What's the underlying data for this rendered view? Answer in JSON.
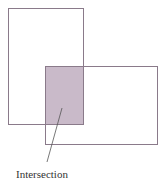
{
  "diagram": {
    "title": "",
    "rect_a": {
      "x": 8,
      "y": 8,
      "w": 75,
      "h": 116
    },
    "rect_b": {
      "x": 45,
      "y": 66,
      "w": 112,
      "h": 78
    },
    "intersection": {
      "x": 45,
      "y": 66,
      "w": 38,
      "h": 58,
      "fill": "#b8a4b8"
    },
    "stroke_color": "#8a7a8a",
    "callout_label": "Intersection",
    "callout_line": {
      "x1": 62,
      "y1": 108,
      "x2": 47,
      "y2": 162
    }
  }
}
